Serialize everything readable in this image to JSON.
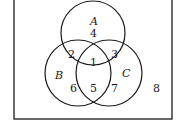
{
  "diagram": {
    "type": "venn",
    "sets": [
      {
        "name": "A",
        "label": "A"
      },
      {
        "name": "B",
        "label": "B"
      },
      {
        "name": "C",
        "label": "C"
      }
    ],
    "regions": {
      "A_only": "4",
      "A_and_B": "2",
      "A_and_C": "3",
      "A_and_B_and_C": "1",
      "B_only": "6",
      "B_and_C": "5",
      "C_only": "7",
      "outside": "8"
    },
    "colors": {
      "stroke": "#1a1a1a",
      "background": "#ffffff"
    }
  }
}
